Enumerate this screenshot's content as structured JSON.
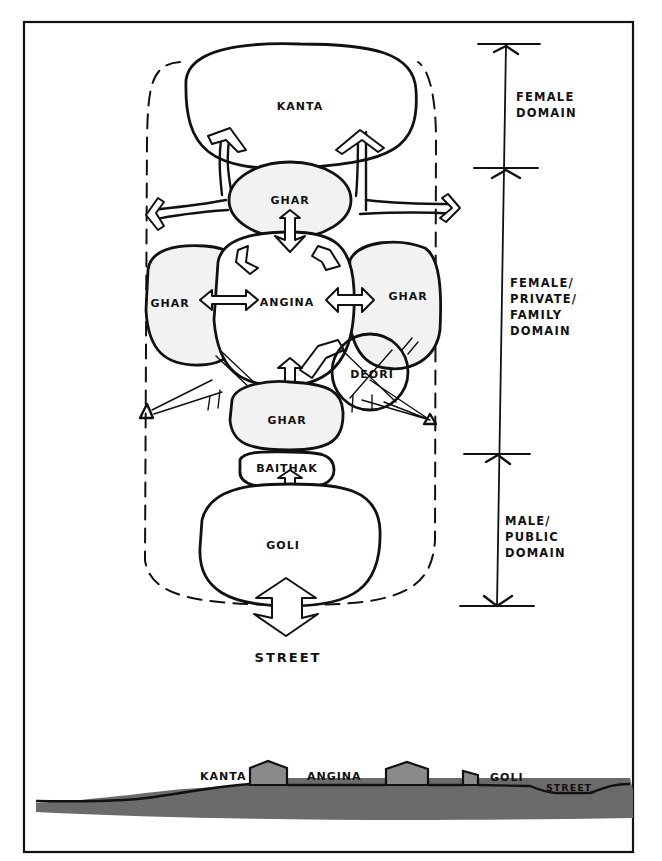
{
  "diagram": {
    "type": "architectural-sketch",
    "plan": {
      "rooms": [
        {
          "id": "kanta",
          "label": "KANTA"
        },
        {
          "id": "ghar-top",
          "label": "GHAR"
        },
        {
          "id": "ghar-left",
          "label": "GHAR"
        },
        {
          "id": "angina",
          "label": "ANGINA"
        },
        {
          "id": "ghar-right",
          "label": "GHAR"
        },
        {
          "id": "deori",
          "label": "DEORI"
        },
        {
          "id": "ghar-bottom",
          "label": "GHAR"
        },
        {
          "id": "baithak",
          "label": "BAITHAK"
        },
        {
          "id": "goli",
          "label": "GOLI"
        }
      ],
      "street_label": "STREET",
      "observer_marks": [
        "left-observer",
        "right-observer"
      ]
    },
    "scale_bar": {
      "zones": [
        {
          "id": "female",
          "lines": [
            "FEMALE",
            "DOMAIN"
          ]
        },
        {
          "id": "female-private",
          "lines": [
            "FEMALE/",
            "PRIVATE/",
            "FAMILY",
            "DOMAIN"
          ]
        },
        {
          "id": "male-public",
          "lines": [
            "MALE/",
            "PUBLIC",
            "DOMAIN"
          ]
        }
      ]
    },
    "section": {
      "labels": [
        "KANTA",
        "ANGINA",
        "GOLI",
        "STREET"
      ]
    }
  }
}
